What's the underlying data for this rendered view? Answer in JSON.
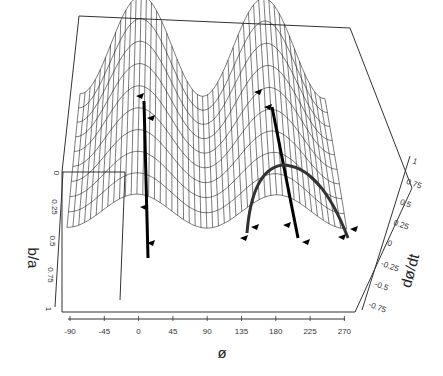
{
  "chart_data": {
    "type": "surface3d",
    "title": "",
    "xlabel": "ø",
    "ylabel": "b/a",
    "zlabel": "dø/dt",
    "x_ticks": [
      "-90",
      "-45",
      "0",
      "45",
      "90",
      "135",
      "180",
      "225",
      "270"
    ],
    "y_ticks": [
      "0",
      "0.25",
      "0.5",
      "0.75",
      "1"
    ],
    "z_ticks": [
      "1",
      "0.75",
      "0.5",
      "0.25",
      "0",
      "-0.25",
      "-0.5",
      "-0.75"
    ],
    "xlim": [
      -90,
      270
    ],
    "ylim": [
      0,
      1
    ],
    "zlim": [
      -0.75,
      1
    ],
    "surface_function": "dφ/dt ≈ cos(2φ)-like with amplitude decreasing as b/a increases",
    "trajectories": [
      {
        "name": "stable-point-trajectory",
        "phi": 0,
        "direction": "downward"
      },
      {
        "name": "unstable-point-trajectory",
        "phi": 180,
        "direction": "upward"
      },
      {
        "name": "arc-trajectory",
        "phi_range": [
          135,
          225
        ],
        "shape": "parabolic arc"
      }
    ],
    "grid": false,
    "legend": null
  },
  "axes": {
    "x": {
      "title": "ø",
      "ticks": [
        "-90",
        "-45",
        "0",
        "45",
        "90",
        "135",
        "180",
        "225",
        "270"
      ]
    },
    "y": {
      "title": "b/a",
      "ticks": [
        "0",
        "0.25",
        "0.5",
        "0.75",
        "1"
      ]
    },
    "z": {
      "title": "dø/dt",
      "ticks": [
        "1",
        "0.75",
        "0.5",
        "0.25",
        "0",
        "-0.25",
        "-0.5",
        "-0.75"
      ]
    }
  },
  "colors": {
    "line": "#222222",
    "trajectory": "#000000",
    "background": "#ffffff"
  }
}
